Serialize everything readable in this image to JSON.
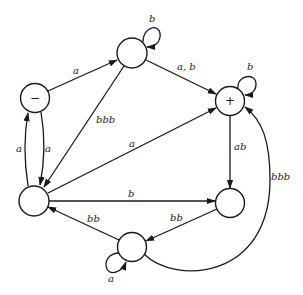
{
  "diagram": {
    "type": "finite-automaton",
    "nodes": [
      {
        "id": "start",
        "symbol": "−",
        "role": "start"
      },
      {
        "id": "top",
        "symbol": ""
      },
      {
        "id": "final",
        "symbol": "+",
        "role": "final"
      },
      {
        "id": "left",
        "symbol": ""
      },
      {
        "id": "right",
        "symbol": ""
      },
      {
        "id": "bottom",
        "symbol": ""
      }
    ],
    "edges": [
      {
        "from": "start",
        "to": "top",
        "label": "a"
      },
      {
        "from": "top",
        "to": "top",
        "label": "b"
      },
      {
        "from": "top",
        "to": "final",
        "label": "a, b"
      },
      {
        "from": "top",
        "to": "left",
        "label": "bbb"
      },
      {
        "from": "final",
        "to": "final",
        "label": "b"
      },
      {
        "from": "left",
        "to": "start",
        "label": "a"
      },
      {
        "from": "start",
        "to": "left",
        "label": "a"
      },
      {
        "from": "left",
        "to": "final",
        "label": "a"
      },
      {
        "from": "final",
        "to": "right",
        "label": "ab"
      },
      {
        "from": "left",
        "to": "right",
        "label": "b"
      },
      {
        "from": "right",
        "to": "bottom",
        "label": "bb"
      },
      {
        "from": "bottom",
        "to": "left",
        "label": "bb"
      },
      {
        "from": "bottom",
        "to": "bottom",
        "label": "a"
      },
      {
        "from": "bottom",
        "to": "final",
        "label": "bbb"
      }
    ]
  },
  "labels": {
    "start_symbol": "−",
    "final_symbol": "+",
    "e_start_top": "a",
    "e_top_loop": "b",
    "e_top_final": "a, b",
    "e_top_left": "bbb",
    "e_final_loop": "b",
    "e_left_start": "a",
    "e_start_left": "a",
    "e_left_final": "a",
    "e_final_right": "ab",
    "e_left_right": "b",
    "e_right_bottom": "bb",
    "e_bottom_left": "bb",
    "e_bottom_loop": "a",
    "e_bottom_final": "bbb"
  }
}
